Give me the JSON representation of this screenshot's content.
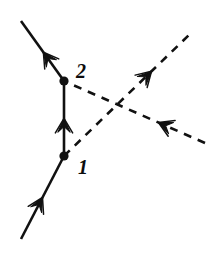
{
  "figure": {
    "kind": "feynman-diagram",
    "title": "",
    "background_color": "#ffffff",
    "ink_color": "#111111",
    "width": 211,
    "height": 256
  },
  "vertices": [
    {
      "id": "vertex-1",
      "label": "1",
      "x": 64,
      "y": 156,
      "label_x": 78,
      "label_y": 174,
      "dot_radius": 4.6
    },
    {
      "id": "vertex-2",
      "label": "2",
      "x": 64,
      "y": 81,
      "label_x": 76,
      "label_y": 78,
      "dot_radius": 4.6
    }
  ],
  "lines": [
    {
      "id": "fermion-in-lower-left",
      "style": "solid",
      "x1": 21,
      "y1": 239,
      "x2": 64,
      "y2": 156,
      "arrow_t": 0.5,
      "arrow_direction": "toward-vertex-1",
      "width": 2.6
    },
    {
      "id": "fermion-out-upper-left",
      "style": "solid",
      "x1": 64,
      "y1": 81,
      "x2": 21,
      "y2": 21,
      "arrow_t": 0.48,
      "arrow_direction": "away-from-vertex-2",
      "width": 2.6
    },
    {
      "id": "fermion-internal-propagator",
      "style": "solid",
      "x1": 64,
      "y1": 156,
      "x2": 64,
      "y2": 81,
      "arrow_t": 0.5,
      "arrow_direction": "upward-vertex-1-to-vertex-2",
      "width": 2.6
    },
    {
      "id": "photon-out-upper-right",
      "style": "dashed",
      "x1": 64,
      "y1": 156,
      "x2": 189,
      "y2": 35,
      "arrow_t": 0.7,
      "arrow_direction": "outgoing-upper-right",
      "width": 2.6,
      "dash_pattern": "8 7"
    },
    {
      "id": "photon-in-lower-right",
      "style": "dashed",
      "x1": 205,
      "y1": 143,
      "x2": 64,
      "y2": 81,
      "arrow_t": 0.33,
      "arrow_direction": "incoming-toward-vertex-2",
      "width": 2.6,
      "dash_pattern": "8 7"
    }
  ],
  "crossing_point": {
    "x": 118,
    "y": 108
  }
}
